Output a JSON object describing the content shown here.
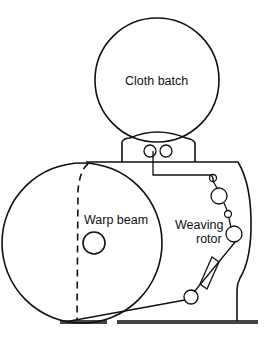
{
  "diagram": {
    "labels": {
      "cloth_batch": "Cloth batch",
      "warp_beam": "Warp beam",
      "weaving_line1": "Weaving",
      "weaving_line2": "rotor"
    },
    "colors": {
      "line": "#111111",
      "ground": "#444444",
      "background": "#ffffff"
    }
  }
}
